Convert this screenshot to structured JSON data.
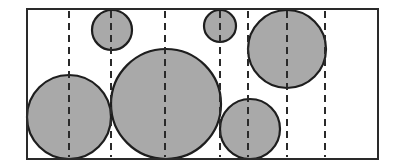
{
  "diagram": {
    "colors": {
      "background": "#ffffff",
      "frame_stroke": "#2a2a2a",
      "circle_fill": "#a9a9a9",
      "circle_stroke": "#1e1e1e",
      "guide_stroke": "#2a2a2a"
    },
    "frame": {
      "x": 27,
      "y": 9,
      "width": 351,
      "height": 150
    },
    "guides_x": [
      69,
      111,
      165,
      220,
      248,
      287,
      325
    ],
    "circles": [
      {
        "id": "circle-bottom-left",
        "cx": 69,
        "cy": 117,
        "r": 42
      },
      {
        "id": "circle-top-small-left",
        "cx": 112,
        "cy": 30,
        "r": 20
      },
      {
        "id": "circle-bottom-large",
        "cx": 166,
        "cy": 104,
        "r": 55
      },
      {
        "id": "circle-top-small-middle",
        "cx": 220,
        "cy": 26,
        "r": 16
      },
      {
        "id": "circle-bottom-right",
        "cx": 250,
        "cy": 129,
        "r": 30
      },
      {
        "id": "circle-top-right",
        "cx": 287,
        "cy": 49,
        "r": 39
      }
    ]
  }
}
